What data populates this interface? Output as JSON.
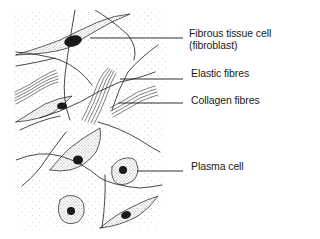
{
  "figure": {
    "labels": [
      {
        "id": "fibroblast",
        "line1": "Fibrous tissue cell",
        "line2": "(fibroblast)"
      },
      {
        "id": "elastic",
        "line1": "Elastic fibres"
      },
      {
        "id": "collagen",
        "line1": "Collagen fibres"
      },
      {
        "id": "plasma",
        "line1": "Plasma cell"
      }
    ]
  },
  "colors": {
    "ink": "#1a1a1a",
    "stipple": "#9a9a9a",
    "background": "#ffffff"
  }
}
